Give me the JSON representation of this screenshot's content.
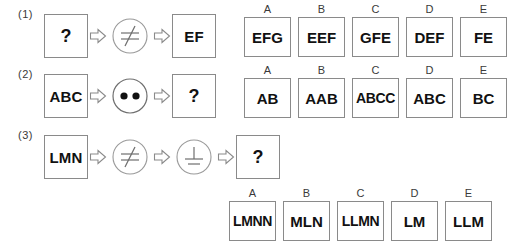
{
  "puzzle": {
    "rows": [
      {
        "label": "(1)",
        "sequence": [
          {
            "kind": "term",
            "text": "?"
          },
          {
            "kind": "arrow",
            "icon": "right-block-arrow-icon"
          },
          {
            "kind": "operator",
            "icon": "not-equal-circle-icon",
            "symbol": "≠"
          },
          {
            "kind": "arrow",
            "icon": "right-block-arrow-icon"
          },
          {
            "kind": "term",
            "text": "EF"
          }
        ],
        "options": [
          {
            "letter": "A",
            "text": "EFG"
          },
          {
            "letter": "B",
            "text": "EEF"
          },
          {
            "letter": "C",
            "text": "GFE"
          },
          {
            "letter": "D",
            "text": "DEF"
          },
          {
            "letter": "E",
            "text": "FE"
          }
        ]
      },
      {
        "label": "(2)",
        "sequence": [
          {
            "kind": "term",
            "text": "ABC"
          },
          {
            "kind": "arrow",
            "icon": "right-block-arrow-icon"
          },
          {
            "kind": "operator",
            "icon": "two-dots-circle-icon",
            "symbol": "••"
          },
          {
            "kind": "arrow",
            "icon": "right-block-arrow-icon"
          },
          {
            "kind": "term",
            "text": "?"
          }
        ],
        "options": [
          {
            "letter": "A",
            "text": "AB"
          },
          {
            "letter": "B",
            "text": "AAB"
          },
          {
            "letter": "C",
            "text": "ABCC"
          },
          {
            "letter": "D",
            "text": "ABC"
          },
          {
            "letter": "E",
            "text": "BC"
          }
        ]
      },
      {
        "label": "(3)",
        "sequence": [
          {
            "kind": "term",
            "text": "LMN"
          },
          {
            "kind": "arrow",
            "icon": "right-block-arrow-icon"
          },
          {
            "kind": "operator",
            "icon": "not-equal-circle-icon",
            "symbol": "≠"
          },
          {
            "kind": "arrow",
            "icon": "right-block-arrow-icon"
          },
          {
            "kind": "operator",
            "icon": "perpendicular-ground-circle-icon",
            "symbol": "⊥"
          },
          {
            "kind": "arrow",
            "icon": "right-block-arrow-icon"
          },
          {
            "kind": "term",
            "text": "?"
          }
        ],
        "options": [
          {
            "letter": "A",
            "text": "LMNN"
          },
          {
            "letter": "B",
            "text": "MLN"
          },
          {
            "letter": "C",
            "text": "LLMN"
          },
          {
            "letter": "D",
            "text": "LM"
          },
          {
            "letter": "E",
            "text": "LLM"
          }
        ]
      }
    ]
  },
  "colors": {
    "background": "#ffffff",
    "box_border": "#8a8a8a",
    "text": "#111111",
    "label_text": "#3a3a3a",
    "operator_stroke": "#8a8a8a",
    "dot_fill": "#111111"
  }
}
